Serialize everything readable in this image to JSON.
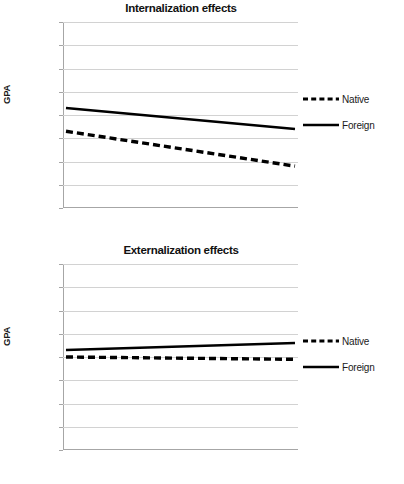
{
  "figure": {
    "panels": [
      {
        "id": "internalization",
        "title": "Internalization effects",
        "ylabel": "GPA",
        "legend": [
          {
            "label": "Native",
            "style": "dashed"
          },
          {
            "label": "Foreign",
            "style": "solid"
          }
        ],
        "yticks": [
          "3.1",
          "3.05",
          "3",
          "2.95",
          "2.9",
          "2.85",
          "2.8",
          "2.75",
          "2.7"
        ]
      },
      {
        "id": "externalization",
        "title": "Externalization effects",
        "ylabel": "GPA",
        "legend": [
          {
            "label": "Native",
            "style": "dashed"
          },
          {
            "label": "Foreign",
            "style": "solid"
          }
        ],
        "yticks": [
          "3.1",
          "3.05",
          "3",
          "2.95",
          "2.9",
          "2.85",
          "2.8",
          "2.75",
          "2.7"
        ]
      }
    ]
  },
  "chart_data": [
    {
      "type": "line",
      "title": "Internalization effects",
      "xlabel": "",
      "ylabel": "GPA",
      "ylim": [
        2.7,
        3.1
      ],
      "ytick_values": [
        3.1,
        3.05,
        3.0,
        2.95,
        2.9,
        2.85,
        2.8,
        2.75,
        2.7
      ],
      "ytick_labels": [
        "3.1",
        "3.05",
        "3",
        "2.95",
        "2.9",
        "2.85",
        "2.8",
        "2.75",
        "2.7"
      ],
      "x": [
        0,
        1
      ],
      "xtick_labels": [],
      "grid": true,
      "legend_position": "right",
      "series": [
        {
          "name": "Native",
          "style": "dashed",
          "color": "#000000",
          "values": [
            2.865,
            2.79
          ]
        },
        {
          "name": "Foreign",
          "style": "solid",
          "color": "#000000",
          "values": [
            2.915,
            2.87
          ]
        }
      ]
    },
    {
      "type": "line",
      "title": "Externalization effects",
      "xlabel": "",
      "ylabel": "GPA",
      "ylim": [
        2.7,
        3.1
      ],
      "ytick_values": [
        3.1,
        3.05,
        3.0,
        2.95,
        2.9,
        2.85,
        2.8,
        2.75,
        2.7
      ],
      "ytick_labels": [
        "3.1",
        "3.05",
        "3",
        "2.95",
        "2.9",
        "2.85",
        "2.8",
        "2.75",
        "2.7"
      ],
      "x": [
        0,
        1
      ],
      "xtick_labels": [],
      "grid": true,
      "legend_position": "right",
      "series": [
        {
          "name": "Native",
          "style": "dashed",
          "color": "#000000",
          "values": [
            2.9,
            2.895
          ]
        },
        {
          "name": "Foreign",
          "style": "solid",
          "color": "#000000",
          "values": [
            2.915,
            2.93
          ]
        }
      ]
    }
  ]
}
